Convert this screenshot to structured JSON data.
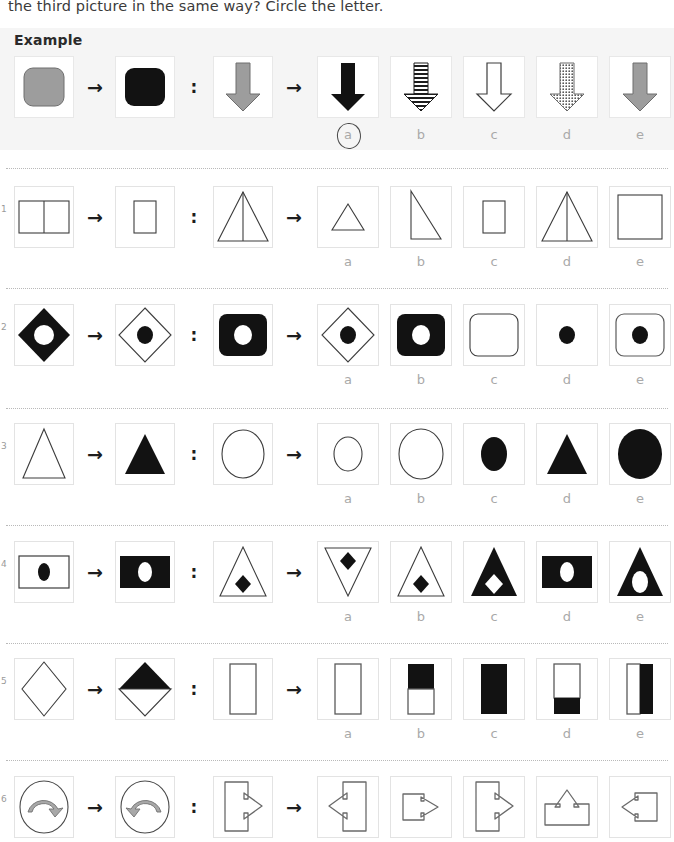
{
  "page": {
    "instruction": "the third picture in the same way? Circle the letter.",
    "example_label": "Example",
    "option_letters": [
      "a",
      "b",
      "c",
      "d",
      "e"
    ],
    "arrow_glyph": "→",
    "colon_glyph": ":",
    "colors": {
      "black": "#121212",
      "gray_fill": "#9d9d9d",
      "outline": "#4a4a4a",
      "cell_border": "#e3e3e3",
      "band_bg": "#f5f5f5",
      "letter": "#a9a9a9",
      "divider": "#b9b9b9"
    },
    "circled_answer": "a"
  },
  "rows": [
    {
      "id": "example",
      "number": "",
      "is_example": true,
      "prompt": [
        {
          "name": "gray-rounded-square",
          "desc": "gray rounded square"
        },
        {
          "name": "black-rounded-square",
          "desc": "black rounded square"
        },
        {
          "name": "gray-down-arrow",
          "desc": "gray down arrow"
        }
      ],
      "options": [
        {
          "letter": "a",
          "name": "black-down-arrow",
          "desc": "solid black down arrow"
        },
        {
          "letter": "b",
          "name": "striped-down-arrow",
          "desc": "horizontally striped down arrow"
        },
        {
          "letter": "c",
          "name": "outline-down-arrow",
          "desc": "white outline down arrow"
        },
        {
          "letter": "d",
          "name": "dotted-down-arrow",
          "desc": "dotted-texture down arrow"
        },
        {
          "letter": "e",
          "name": "gray-down-arrow",
          "desc": "gray down arrow"
        }
      ]
    },
    {
      "id": "q1",
      "number": "1",
      "is_example": false,
      "prompt": [
        {
          "name": "divided-wide-rectangle",
          "desc": "wide rectangle split by vertical line"
        },
        {
          "name": "small-tall-rectangle",
          "desc": "small tall rectangle"
        },
        {
          "name": "triangle-with-median",
          "desc": "triangle with vertical median line"
        }
      ],
      "options": [
        {
          "letter": "a",
          "name": "small-triangle",
          "desc": "small plain triangle"
        },
        {
          "letter": "b",
          "name": "right-triangle",
          "desc": "right-angled triangle"
        },
        {
          "letter": "c",
          "name": "small-rectangle",
          "desc": "small rectangle"
        },
        {
          "letter": "d",
          "name": "triangle-with-median",
          "desc": "triangle with vertical median"
        },
        {
          "letter": "e",
          "name": "large-square",
          "desc": "large square"
        }
      ]
    },
    {
      "id": "q2",
      "number": "2",
      "is_example": false,
      "prompt": [
        {
          "name": "black-diamond-white-hole",
          "desc": "black diamond with white circular hole"
        },
        {
          "name": "outline-diamond-black-dot",
          "desc": "outline diamond with black dot"
        },
        {
          "name": "black-rounded-square-white-hole",
          "desc": "black rounded square with white hole"
        }
      ],
      "options": [
        {
          "letter": "a",
          "name": "outline-diamond-black-dot",
          "desc": "outline diamond with black dot"
        },
        {
          "letter": "b",
          "name": "black-rounded-square-white-hole",
          "desc": "black rounded square with white hole"
        },
        {
          "letter": "c",
          "name": "empty-rounded-square",
          "desc": "empty outline rounded square"
        },
        {
          "letter": "d",
          "name": "black-dot",
          "desc": "black dot alone"
        },
        {
          "letter": "e",
          "name": "outline-rounded-square-black-dot",
          "desc": "outline rounded square with black dot"
        }
      ]
    },
    {
      "id": "q3",
      "number": "3",
      "is_example": false,
      "prompt": [
        {
          "name": "outline-triangle",
          "desc": "outline triangle"
        },
        {
          "name": "black-triangle",
          "desc": "solid black triangle"
        },
        {
          "name": "outline-circle",
          "desc": "outline circle"
        }
      ],
      "options": [
        {
          "letter": "a",
          "name": "small-outline-circle",
          "desc": "small outline circle"
        },
        {
          "letter": "b",
          "name": "large-outline-circle",
          "desc": "large outline circle"
        },
        {
          "letter": "c",
          "name": "small-black-circle",
          "desc": "small solid black circle"
        },
        {
          "letter": "d",
          "name": "black-triangle",
          "desc": "solid black triangle"
        },
        {
          "letter": "e",
          "name": "large-black-circle",
          "desc": "large solid black circle"
        }
      ]
    },
    {
      "id": "q4",
      "number": "4",
      "is_example": false,
      "prompt": [
        {
          "name": "outline-rectangle-black-ellipse",
          "desc": "outline rectangle with black ellipse"
        },
        {
          "name": "black-rectangle-white-ellipse",
          "desc": "black rectangle with white ellipse"
        },
        {
          "name": "outline-triangle-black-diamond",
          "desc": "outline triangle with black diamond"
        }
      ],
      "options": [
        {
          "letter": "a",
          "name": "inverted-outline-triangle-black-diamond",
          "desc": "inverted outline triangle with black diamond"
        },
        {
          "letter": "b",
          "name": "outline-triangle-black-diamond",
          "desc": "outline triangle with black diamond"
        },
        {
          "letter": "c",
          "name": "black-triangle-white-diamond",
          "desc": "black triangle with white diamond"
        },
        {
          "letter": "d",
          "name": "black-rectangle-white-ellipse",
          "desc": "black rectangle with white ellipse"
        },
        {
          "letter": "e",
          "name": "black-triangle-white-ellipse",
          "desc": "black triangle with white ellipse"
        }
      ]
    },
    {
      "id": "q5",
      "number": "5",
      "is_example": false,
      "prompt": [
        {
          "name": "outline-diamond",
          "desc": "outline diamond"
        },
        {
          "name": "diamond-top-half-black",
          "desc": "diamond with black top half"
        },
        {
          "name": "outline-tall-rectangle",
          "desc": "outline tall rectangle"
        }
      ],
      "options": [
        {
          "letter": "a",
          "name": "empty-tall-rectangle",
          "desc": "empty tall rectangle"
        },
        {
          "letter": "b",
          "name": "rectangle-top-half-black",
          "desc": "rectangle with black top half"
        },
        {
          "letter": "c",
          "name": "solid-black-rectangle",
          "desc": "fully black rectangle"
        },
        {
          "letter": "d",
          "name": "rectangle-bottom-third-black",
          "desc": "rectangle with black bottom third"
        },
        {
          "letter": "e",
          "name": "rectangle-right-half-black",
          "desc": "rectangle with black right half"
        }
      ]
    },
    {
      "id": "q6",
      "number": "6",
      "is_example": false,
      "prompt": [
        {
          "name": "circle-curved-arrow-right",
          "desc": "circle containing curved gray arrow pointing right"
        },
        {
          "name": "circle-curved-arrow-left",
          "desc": "circle containing curved gray arrow pointing left"
        },
        {
          "name": "rectangle-arrow-tab-right",
          "desc": "tall rectangle with arrow tab on right"
        }
      ],
      "options": [
        {
          "letter": "a",
          "name": "rectangle-arrow-tab-left",
          "desc": "tall rectangle with arrow tab on left"
        },
        {
          "letter": "b",
          "name": "small-rectangle-arrow-tab-right",
          "desc": "small rectangle with arrow tab on right"
        },
        {
          "letter": "c",
          "name": "rectangle-arrow-tab-right",
          "desc": "tall rectangle with arrow tab on right"
        },
        {
          "letter": "d",
          "name": "rectangle-arrow-tab-up",
          "desc": "rectangle with arrow tab on top"
        },
        {
          "letter": "e",
          "name": "square-arrow-tab-left",
          "desc": "square with arrow tab on left"
        }
      ]
    }
  ]
}
